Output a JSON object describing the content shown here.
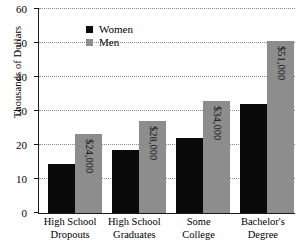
{
  "chart_data": {
    "type": "bar",
    "title": "",
    "xlabel": "",
    "ylabel": "Thousands of Dollars",
    "ylim": [
      0,
      60
    ],
    "yticks": [
      0,
      10,
      20,
      30,
      40,
      50,
      60
    ],
    "grid": true,
    "legend_position": "top-left",
    "categories": [
      [
        "High School",
        "Dropouts"
      ],
      [
        "High School",
        "Graduates"
      ],
      [
        "Some",
        "College"
      ],
      [
        "Bachelor's",
        "Degree"
      ]
    ],
    "series": [
      {
        "name": "Women",
        "color": "#0a0a0a",
        "values": [
          14.5,
          18.5,
          22.2,
          32.0
        ],
        "labels": [
          "",
          "",
          "",
          ""
        ]
      },
      {
        "name": "Men",
        "color": "#8d8d8d",
        "values": [
          23.3,
          27.1,
          33.0,
          50.7
        ],
        "labels": [
          "$24,000",
          "$28,000",
          "$34,000",
          "$51,000"
        ]
      }
    ]
  },
  "axis": {
    "y_title": "Thousands of Dollars",
    "y_tick_labels": [
      "60",
      "50",
      "40",
      "30",
      "20",
      "10",
      "0"
    ],
    "x_tick_labels": [
      {
        "line1": "High School",
        "line2": "Dropouts"
      },
      {
        "line1": "High School",
        "line2": "Graduates"
      },
      {
        "line1": "Some",
        "line2": "College"
      },
      {
        "line1": "Bachelor's",
        "line2": "Degree"
      }
    ]
  },
  "legend": {
    "items": [
      {
        "label": "Women",
        "color": "#0a0a0a"
      },
      {
        "label": "Men",
        "color": "#8d8d8d"
      }
    ]
  }
}
